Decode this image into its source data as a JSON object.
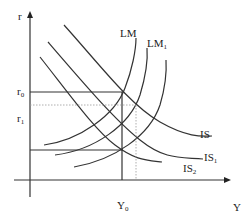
{
  "diagram": {
    "type": "IS-LM diagram",
    "axes": {
      "y_label": "r",
      "x_label": "Y"
    },
    "y_ticks": [
      {
        "label": "r",
        "sub": "0"
      },
      {
        "label": "r",
        "sub": "1"
      }
    ],
    "x_ticks": [
      {
        "label": "Y",
        "sub": "0"
      }
    ],
    "curves": {
      "lm": [
        {
          "label": "LM",
          "sub": ""
        },
        {
          "label": "LM",
          "sub": "1"
        }
      ],
      "is": [
        {
          "label": "IS",
          "sub": ""
        },
        {
          "label": "IS",
          "sub": "1"
        },
        {
          "label": "IS",
          "sub": "2"
        }
      ]
    },
    "colors": {
      "line": "#333333",
      "dotted": "#999999"
    }
  }
}
